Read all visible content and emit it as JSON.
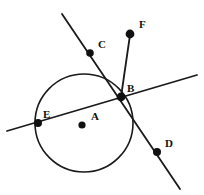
{
  "figure": {
    "canvas": {
      "width": 204,
      "height": 195
    },
    "background_color": "#ffffff",
    "stroke_color": "#1a1a1a",
    "point_color": "#111111",
    "label_color": "#111111"
  },
  "circle": {
    "name": "circle-A",
    "center_label": "A",
    "cx": 84,
    "cy": 123,
    "r": 49,
    "stroke_width": 1.6,
    "fill": "none"
  },
  "points": [
    {
      "label": "A",
      "x": 82,
      "y": 125,
      "r": 3.6,
      "label_x": 91,
      "label_y": 120,
      "role": "center"
    },
    {
      "label": "B",
      "x": 121,
      "y": 97,
      "r": 4.4,
      "label_x": 127,
      "label_y": 92,
      "role": "on-circle"
    },
    {
      "label": "C",
      "x": 90,
      "y": 53,
      "r": 3.8,
      "label_x": 98,
      "label_y": 48,
      "role": "on-secant"
    },
    {
      "label": "D",
      "x": 157,
      "y": 152,
      "r": 4.0,
      "label_x": 165,
      "label_y": 147,
      "role": "on-secant"
    },
    {
      "label": "E",
      "x": 38,
      "y": 123,
      "r": 4.0,
      "label_x": 43,
      "label_y": 118,
      "role": "on-circle"
    },
    {
      "label": "F",
      "x": 130,
      "y": 34,
      "r": 4.4,
      "label_x": 139,
      "label_y": 28,
      "role": "ray-end"
    }
  ],
  "lines": [
    {
      "name": "secant-line-C-B-D",
      "x1": 62,
      "y1": 14,
      "x2": 180,
      "y2": 189,
      "stroke_width": 1.8,
      "through": [
        "C",
        "B",
        "D"
      ]
    },
    {
      "name": "secant-line-E-B",
      "x1": 7,
      "y1": 131,
      "x2": 197,
      "y2": 75,
      "stroke_width": 1.8,
      "through": [
        "E",
        "B"
      ]
    },
    {
      "name": "ray-B-F",
      "x1": 121,
      "y1": 97,
      "x2": 130,
      "y2": 35,
      "stroke_width": 1.8,
      "through": [
        "B",
        "F"
      ]
    }
  ]
}
